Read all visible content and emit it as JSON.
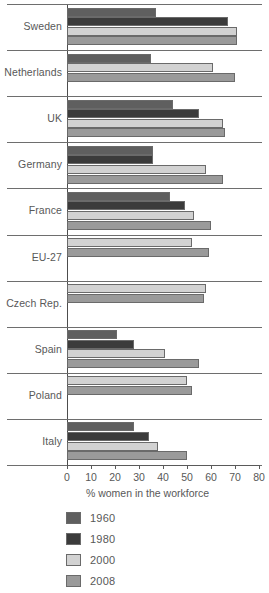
{
  "chart_data": {
    "type": "bar",
    "orientation": "horizontal",
    "title": "",
    "xlabel": "% women in the workforce",
    "ylabel": "",
    "xlim": [
      0,
      80
    ],
    "xticks": [
      0,
      10,
      20,
      30,
      40,
      50,
      60,
      70,
      80
    ],
    "grid": false,
    "legend_position": "below-left",
    "categories": [
      "Sweden",
      "Netherlands",
      "UK",
      "Germany",
      "France",
      "EU-27",
      "Czech Rep.",
      "Spain",
      "Poland",
      "Italy"
    ],
    "series": [
      {
        "name": "1960",
        "color": "#5f5f5f",
        "values": [
          37,
          35,
          44,
          36,
          43,
          null,
          null,
          21,
          null,
          28
        ]
      },
      {
        "name": "1980",
        "color": "#3b3b3b",
        "values": [
          67,
          null,
          55,
          36,
          49,
          null,
          null,
          28,
          null,
          34
        ]
      },
      {
        "name": "2000",
        "color": "#d2d2d2",
        "values": [
          71,
          61,
          65,
          58,
          53,
          52,
          58,
          41,
          50,
          38
        ]
      },
      {
        "name": "2008",
        "color": "#9a9a9a",
        "values": [
          71,
          70,
          66,
          65,
          60,
          59,
          57,
          55,
          52,
          50
        ]
      }
    ]
  },
  "legend": {
    "items": [
      {
        "label": "1960",
        "color": "#5f5f5f"
      },
      {
        "label": "1980",
        "color": "#3b3b3b"
      },
      {
        "label": "2000",
        "color": "#d2d2d2"
      },
      {
        "label": "2008",
        "color": "#9a9a9a"
      }
    ]
  },
  "axis": {
    "x_label": "% women in the workforce",
    "tick_labels": [
      "0",
      "10",
      "20",
      "30",
      "40",
      "50",
      "60",
      "70",
      "80"
    ]
  }
}
